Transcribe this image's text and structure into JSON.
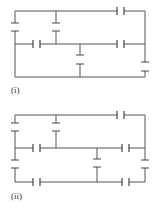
{
  "figure": {
    "diagrams": [
      {
        "id": "i",
        "label": "(i)",
        "description": "Capacitor network with 7 capacitors"
      },
      {
        "id": "ii",
        "label": "(ii)",
        "description": "Capacitor network with 10 capacitors"
      }
    ],
    "colors": {
      "wire": "#555555",
      "background": "#ffffff"
    }
  }
}
